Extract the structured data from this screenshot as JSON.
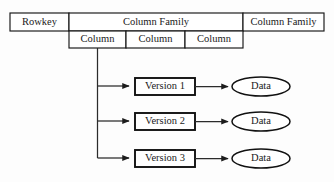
{
  "diagram": {
    "background_color": "#fdfdfd",
    "stroke_color": "#161616",
    "text_color": "#1a1a1a",
    "table": {
      "row1": [
        {
          "label": "Rowkey"
        },
        {
          "label": "Column Family"
        },
        {
          "label": "Column Family"
        }
      ],
      "row2": [
        {
          "label": "Column"
        },
        {
          "label": "Column"
        },
        {
          "label": "Column"
        }
      ]
    },
    "versions": [
      {
        "label": "Version 1",
        "data_label": "Data"
      },
      {
        "label": "Version 2",
        "data_label": "Data"
      },
      {
        "label": "Version 3",
        "data_label": "Data"
      }
    ]
  }
}
